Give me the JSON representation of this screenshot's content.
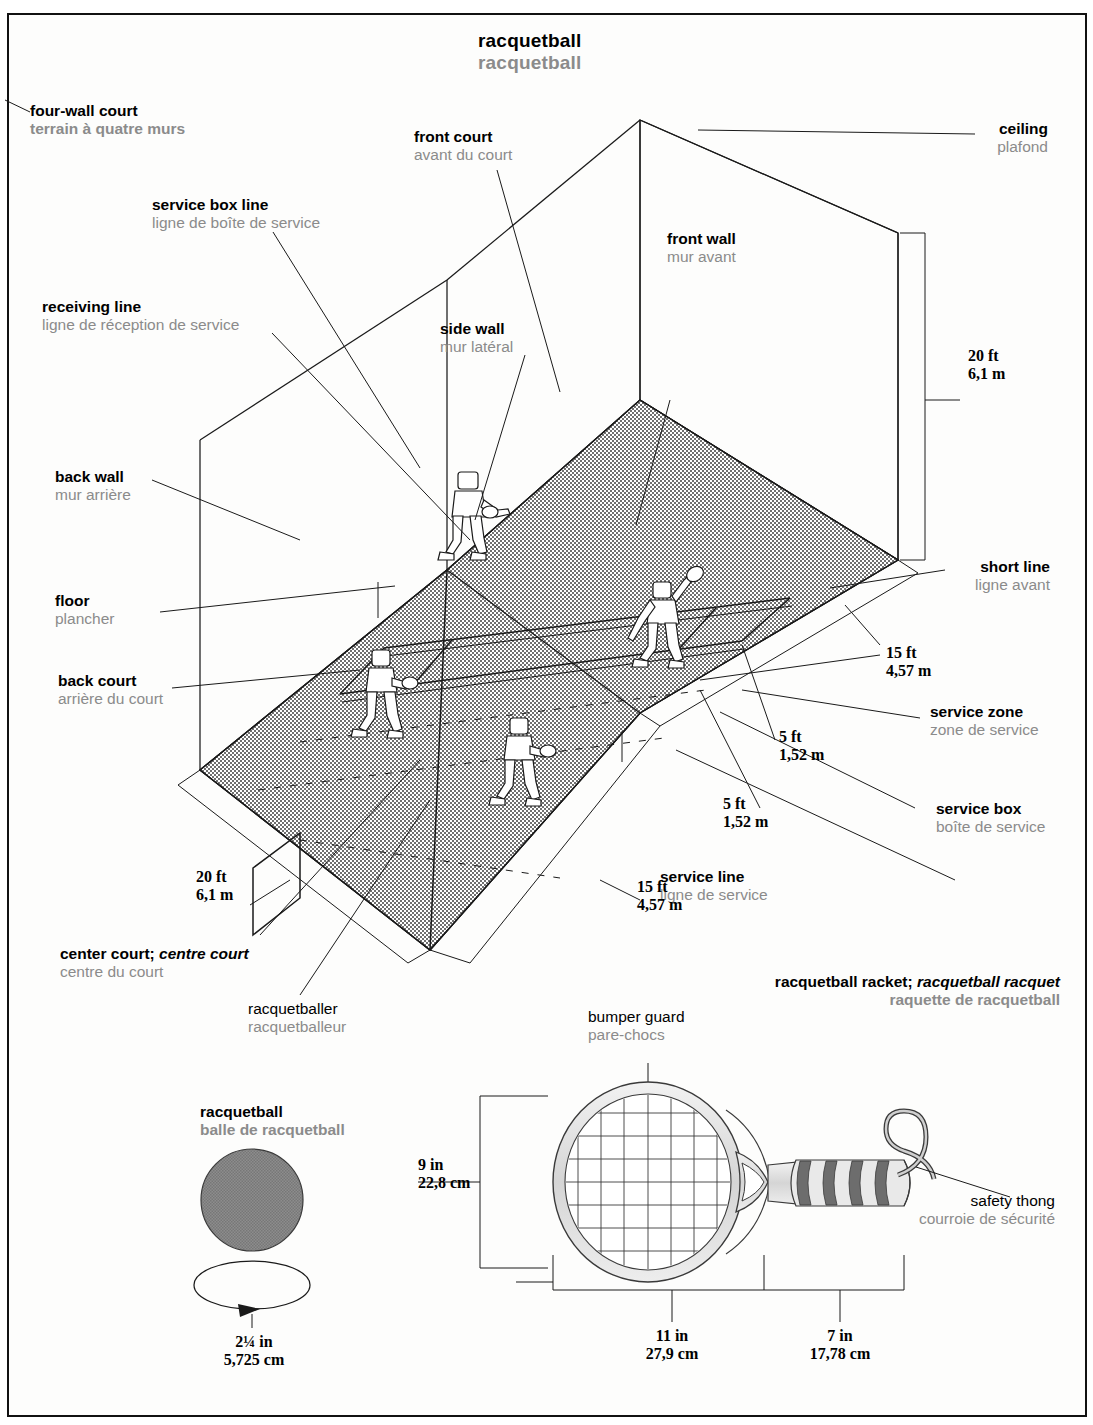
{
  "page": {
    "header_right": "SPORTS DE BALLE",
    "title": {
      "en": "racquetball",
      "fr": "racquetball"
    }
  },
  "court": {
    "heading": {
      "en": "four-wall court",
      "fr": "terrain à quatre murs"
    },
    "labels": [
      {
        "id": "front-court",
        "en": "front court",
        "fr": "avant du court"
      },
      {
        "id": "service-box-line",
        "en": "service box line",
        "fr": "ligne de boîte de service"
      },
      {
        "id": "receiving-line",
        "en": "receiving line",
        "fr": "ligne de réception de service"
      },
      {
        "id": "side-wall",
        "en": "side wall",
        "fr": "mur latéral"
      },
      {
        "id": "front-wall",
        "en": "front wall",
        "fr": "mur avant"
      },
      {
        "id": "ceiling",
        "en": "ceiling",
        "fr": "plafond"
      },
      {
        "id": "back-wall",
        "en": "back wall",
        "fr": "mur arrière"
      },
      {
        "id": "floor",
        "en": "floor",
        "fr": "plancher"
      },
      {
        "id": "back-court",
        "en": "back court",
        "fr": "arrière du court"
      },
      {
        "id": "short-line",
        "en": "short line",
        "fr": "ligne avant"
      },
      {
        "id": "service-zone",
        "en": "service zone",
        "fr": "zone de service"
      },
      {
        "id": "service-box",
        "en": "service box",
        "fr": "boîte de service"
      },
      {
        "id": "service-line",
        "en": "service line",
        "fr": "ligne de service"
      },
      {
        "id": "center-court",
        "en": "center court; ",
        "en_it": "centre court",
        "fr": "centre du court"
      },
      {
        "id": "racquetballer",
        "en": "racquetballer",
        "fr": "racquetballeur"
      }
    ],
    "dimensions": [
      {
        "id": "wall-height",
        "imperial": "20 ft",
        "metric": "6,1 m"
      },
      {
        "id": "court-width",
        "imperial": "20 ft",
        "metric": "6,1 m"
      },
      {
        "id": "front-depth",
        "imperial": "15 ft",
        "metric": "4,57 m"
      },
      {
        "id": "back-depth",
        "imperial": "15 ft",
        "metric": "4,57 m"
      },
      {
        "id": "service-depth",
        "imperial": "5 ft",
        "metric": "1,52 m"
      },
      {
        "id": "box-width",
        "imperial": "5 ft",
        "metric": "1,52 m"
      }
    ]
  },
  "ball": {
    "heading": {
      "en": "racquetball",
      "fr": "balle de racquetball"
    },
    "diameter": {
      "imperial": "2¼ in",
      "metric": "5,725 cm"
    }
  },
  "racket": {
    "heading": {
      "en": "racquetball racket; ",
      "en_it": "racquetball racquet",
      "fr": "raquette de racquetball"
    },
    "labels": [
      {
        "id": "bumper-guard",
        "en": "bumper guard",
        "fr": "pare-chocs"
      },
      {
        "id": "safety-thong",
        "en": "safety thong",
        "fr": "courroie de sécurité"
      }
    ],
    "dimensions": [
      {
        "id": "head-width",
        "imperial": "9 in",
        "metric": "22,8 cm"
      },
      {
        "id": "head-length",
        "imperial": "11 in",
        "metric": "27,9 cm"
      },
      {
        "id": "handle-length",
        "imperial": "7 in",
        "metric": "17,78 cm"
      }
    ]
  },
  "colors": {
    "ink": "#1a1a1a",
    "french_gray": "#8b8b8b",
    "floor_fill": "#8e8e8e",
    "wall_fill": "#9a9a9a",
    "racket_frame": "#d8d8d8",
    "grip_dark": "#6d6d6d"
  }
}
